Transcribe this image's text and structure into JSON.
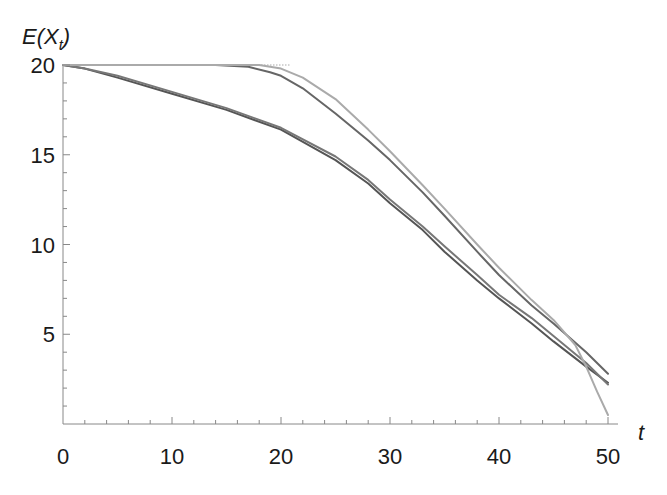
{
  "chart_data": {
    "type": "line",
    "title": "",
    "xlabel": "t",
    "ylabel": "E(X_t)",
    "ylabel_main": "E(X",
    "ylabel_sub": "t",
    "ylabel_close": ")",
    "xlim": [
      0,
      51
    ],
    "ylim": [
      0,
      20
    ],
    "x_ticks": [
      0,
      10,
      20,
      30,
      40,
      50
    ],
    "x_tick_labels": [
      "0",
      "10",
      "20",
      "30",
      "40",
      "50"
    ],
    "x_minor_step": 2,
    "y_ticks": [
      5,
      10,
      15,
      20
    ],
    "y_tick_labels": [
      "5",
      "10",
      "15",
      "20"
    ],
    "y_minor_step": 1,
    "grid": false,
    "legend": null,
    "series": [
      {
        "name": "lower-curve-a",
        "color": "#555555",
        "x": [
          0,
          2,
          5,
          10,
          15,
          20,
          25,
          28,
          30,
          33,
          35,
          38,
          40,
          43,
          45,
          48,
          50
        ],
        "values": [
          20,
          19.8,
          19.3,
          18.4,
          17.5,
          16.4,
          14.7,
          13.4,
          12.3,
          10.8,
          9.6,
          8.0,
          7.0,
          5.6,
          4.6,
          3.2,
          2.3
        ]
      },
      {
        "name": "lower-curve-b",
        "color": "#777777",
        "x": [
          0,
          2,
          5,
          10,
          15,
          20,
          25,
          28,
          30,
          33,
          35,
          38,
          40,
          43,
          45,
          48,
          50
        ],
        "values": [
          20,
          19.8,
          19.4,
          18.5,
          17.6,
          16.5,
          14.9,
          13.6,
          12.5,
          11.0,
          9.9,
          8.3,
          7.2,
          5.9,
          4.9,
          3.4,
          2.2
        ]
      },
      {
        "name": "upper-curve-c",
        "color": "#666666",
        "x": [
          0,
          5,
          10,
          14,
          17,
          19,
          20,
          22,
          25,
          28,
          30,
          33,
          35,
          38,
          40,
          43,
          45,
          48,
          50
        ],
        "values": [
          20,
          20,
          20,
          20,
          19.9,
          19.6,
          19.4,
          18.7,
          17.3,
          15.8,
          14.7,
          12.9,
          11.6,
          9.6,
          8.3,
          6.6,
          5.6,
          4.0,
          2.8
        ]
      },
      {
        "name": "upper-curve-d",
        "color": "#aaaaaa",
        "x": [
          0,
          5,
          10,
          15,
          18,
          20,
          22,
          25,
          28,
          30,
          33,
          35,
          38,
          40,
          43,
          45,
          47,
          48,
          49,
          50
        ],
        "values": [
          20,
          20,
          20,
          20,
          20,
          19.8,
          19.3,
          18.1,
          16.4,
          15.2,
          13.3,
          12.0,
          10.0,
          8.7,
          6.9,
          5.8,
          4.4,
          3.2,
          1.8,
          0.5
        ]
      }
    ]
  }
}
